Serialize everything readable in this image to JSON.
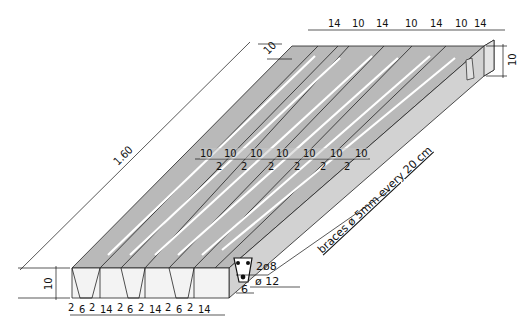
{
  "diagram": {
    "length_label": "1.60",
    "top_dims": [
      "14",
      "10",
      "14",
      "10",
      "14",
      "10",
      "14"
    ],
    "back_thickness_label": "10",
    "right_height_label": "10",
    "mid_dims_upper": [
      "10",
      "10",
      "10",
      "10",
      "10",
      "10",
      "10"
    ],
    "mid_dims_lower": [
      "2",
      "2",
      "2",
      "2",
      "2",
      "2"
    ],
    "front_height_label": "10",
    "bottom_dims": [
      "2",
      "6",
      "2",
      "14",
      "2",
      "6",
      "2",
      "14",
      "2",
      "6",
      "2",
      "14"
    ],
    "rebar_top": "2ø8",
    "rebar_bottom": "ø 12",
    "rib_width": "6",
    "braces_note": "braces ø 5mm every 20 cm",
    "colors": {
      "top_face": "#b8b8b8",
      "side_face": "#d4d4d4",
      "front_face": "#f2f2f2",
      "line": "#111111",
      "groove": "#ffffff"
    }
  }
}
